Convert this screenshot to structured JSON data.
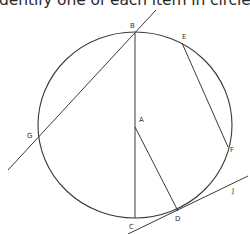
{
  "instruction": {
    "text": "dentify one of each item in circle A."
  },
  "diagram": {
    "title": "Circle A",
    "stroke_color": "#3a3a3a",
    "circle": {
      "center": "A",
      "cx": 135,
      "cy": 125,
      "rx": 97,
      "ry": 93
    },
    "points": [
      {
        "id": "A",
        "label": "A",
        "x": 135,
        "y": 127,
        "lx": 139,
        "ly": 122
      },
      {
        "id": "B",
        "label": "B",
        "x": 135,
        "y": 33,
        "lx": 130,
        "ly": 27
      },
      {
        "id": "C",
        "label": "C",
        "x": 135,
        "y": 218,
        "lx": 129,
        "ly": 229
      },
      {
        "id": "D",
        "label": "D",
        "x": 178,
        "y": 211,
        "lx": 176,
        "ly": 221
      },
      {
        "id": "E",
        "label": "E",
        "x": 182,
        "y": 43,
        "lx": 183,
        "ly": 38
      },
      {
        "id": "F",
        "label": "F",
        "x": 228,
        "y": 147,
        "lx": 231,
        "ly": 152
      },
      {
        "id": "G",
        "label": "G",
        "x": 38,
        "y": 134,
        "lx": 28,
        "ly": 138
      },
      {
        "id": "J",
        "label": "J",
        "x": 235,
        "y": 190,
        "lx": 232,
        "ly": 192
      }
    ],
    "segments": [
      {
        "name": "diameter-BC",
        "from": "B",
        "to": "C",
        "x1": 135,
        "y1": 33,
        "x2": 135,
        "y2": 218
      },
      {
        "name": "radius-AD",
        "from": "A",
        "to": "D",
        "x1": 135,
        "y1": 127,
        "x2": 178,
        "y2": 211
      },
      {
        "name": "chord-EF",
        "from": "E",
        "to": "F",
        "x1": 182,
        "y1": 43,
        "x2": 228,
        "y2": 147
      },
      {
        "name": "secant-BG",
        "from": "B",
        "to": "G",
        "x1": 156,
        "y1": 10,
        "x2": 8,
        "y2": 170
      },
      {
        "name": "tangent-DJ",
        "from": "D",
        "to": "J",
        "x1": 128,
        "y1": 234,
        "x2": 248,
        "y2": 176
      }
    ]
  }
}
